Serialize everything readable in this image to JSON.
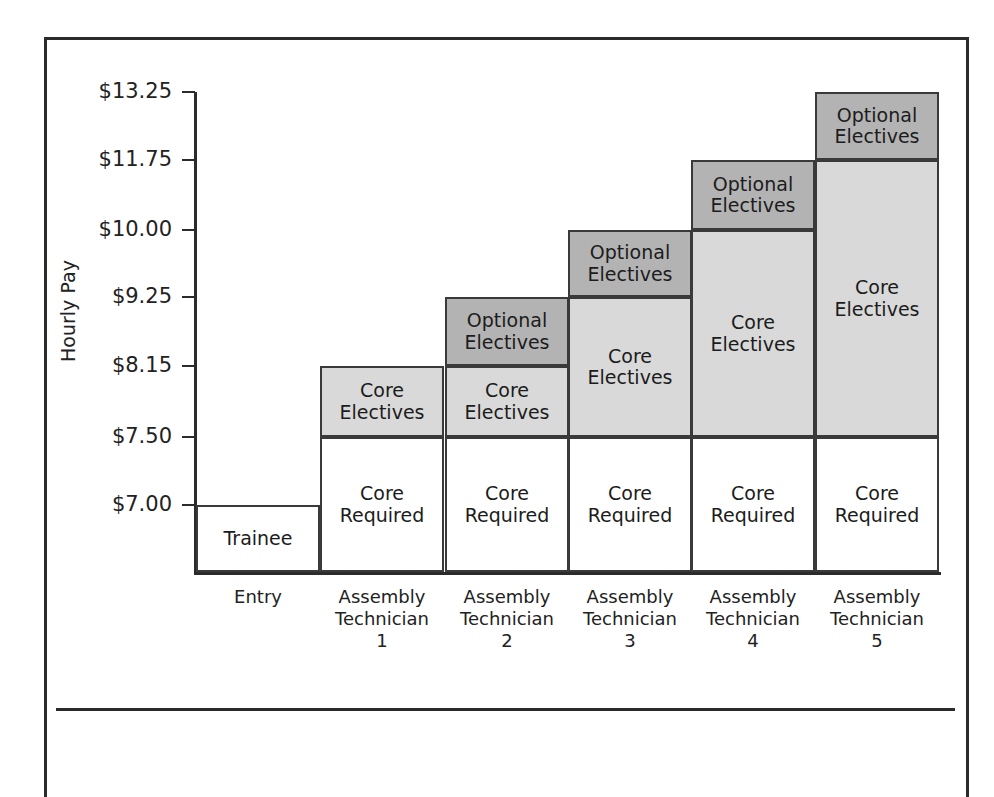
{
  "chart_data": {
    "type": "bar",
    "subtype": "stacked-step-career-ladder",
    "title": "",
    "xlabel": "",
    "ylabel": "Hourly Pay",
    "grid": false,
    "legend": "none",
    "y_tick_labels": [
      "$13.25",
      "$11.75",
      "$10.00",
      "$9.25",
      "$8.15",
      "$7.50",
      "$7.00"
    ],
    "y_tick_values": [
      13.25,
      11.75,
      10.0,
      9.25,
      8.15,
      7.5,
      7.0
    ],
    "ylim": [
      7.0,
      13.25
    ],
    "categories": [
      "Entry",
      "Assembly Technician 1",
      "Assembly Technician 2",
      "Assembly Technician 3",
      "Assembly Technician 4",
      "Assembly Technician 5"
    ],
    "segment_names": [
      "Trainee",
      "Core Required",
      "Core Electives",
      "Optional Electives"
    ],
    "series": [
      {
        "name": "Trainee",
        "values": [
          7.0,
          null,
          null,
          null,
          null,
          null
        ]
      },
      {
        "name": "Core Required",
        "values": [
          null,
          7.5,
          7.5,
          7.5,
          7.5,
          7.5
        ]
      },
      {
        "name": "Core Electives",
        "values": [
          null,
          8.15,
          8.15,
          9.25,
          10.0,
          11.75
        ]
      },
      {
        "name": "Optional Electives",
        "values": [
          null,
          null,
          9.25,
          10.0,
          11.75,
          13.25
        ]
      }
    ],
    "columns": [
      {
        "category_lines": [
          "Entry"
        ],
        "segments": [
          {
            "label_lines": [
              "Trainee"
            ],
            "top": 7.0,
            "bottom": 0,
            "fill": "white"
          }
        ]
      },
      {
        "category_lines": [
          "Assembly",
          "Technician",
          "1"
        ],
        "segments": [
          {
            "label_lines": [
              "Core",
              "Electives"
            ],
            "top": 8.15,
            "bottom": 7.5,
            "fill": "light"
          },
          {
            "label_lines": [
              "Core",
              "Required"
            ],
            "top": 7.5,
            "bottom": 0,
            "fill": "white"
          }
        ]
      },
      {
        "category_lines": [
          "Assembly",
          "Technician",
          "2"
        ],
        "segments": [
          {
            "label_lines": [
              "Optional",
              "Electives"
            ],
            "top": 9.25,
            "bottom": 8.15,
            "fill": "mid"
          },
          {
            "label_lines": [
              "Core",
              "Electives"
            ],
            "top": 8.15,
            "bottom": 7.5,
            "fill": "light"
          },
          {
            "label_lines": [
              "Core",
              "Required"
            ],
            "top": 7.5,
            "bottom": 0,
            "fill": "white"
          }
        ]
      },
      {
        "category_lines": [
          "Assembly",
          "Technician",
          "3"
        ],
        "segments": [
          {
            "label_lines": [
              "Optional",
              "Electives"
            ],
            "top": 10.0,
            "bottom": 9.25,
            "fill": "mid"
          },
          {
            "label_lines": [
              "Core",
              "Electives"
            ],
            "top": 9.25,
            "bottom": 7.5,
            "fill": "light"
          },
          {
            "label_lines": [
              "Core",
              "Required"
            ],
            "top": 7.5,
            "bottom": 0,
            "fill": "white"
          }
        ]
      },
      {
        "category_lines": [
          "Assembly",
          "Technician",
          "4"
        ],
        "segments": [
          {
            "label_lines": [
              "Optional",
              "Electives"
            ],
            "top": 11.75,
            "bottom": 10.0,
            "fill": "mid"
          },
          {
            "label_lines": [
              "Core",
              "Electives"
            ],
            "top": 10.0,
            "bottom": 7.5,
            "fill": "light"
          },
          {
            "label_lines": [
              "Core",
              "Required"
            ],
            "top": 7.5,
            "bottom": 0,
            "fill": "white"
          }
        ]
      },
      {
        "category_lines": [
          "Assembly",
          "Technician",
          "5"
        ],
        "segments": [
          {
            "label_lines": [
              "Optional",
              "Electives"
            ],
            "top": 13.25,
            "bottom": 11.75,
            "fill": "mid"
          },
          {
            "label_lines": [
              "Core",
              "Electives"
            ],
            "top": 11.75,
            "bottom": 7.5,
            "fill": "light"
          },
          {
            "label_lines": [
              "Core",
              "Required"
            ],
            "top": 7.5,
            "bottom": 0,
            "fill": "white"
          }
        ]
      }
    ],
    "colors": {
      "optional_electives": "#b3b3b3",
      "core_electives": "#d9d9d9",
      "core_required": "#ffffff",
      "trainee": "#ffffff",
      "stroke": "#3a3a3a",
      "axis": "#2b2b2b",
      "text": "#1c1c1c"
    }
  },
  "_layout": {
    "tick_y_px": {
      "13.25": 92,
      "11.75": 160,
      "10.00": 230,
      "9.25": 297,
      "8.15": 366,
      "7.50": 437,
      "7.00": 505
    },
    "baseline_y_px": 572,
    "col_left_px": [
      196,
      320,
      445,
      568,
      691,
      815
    ],
    "col_width_px": 124
  }
}
